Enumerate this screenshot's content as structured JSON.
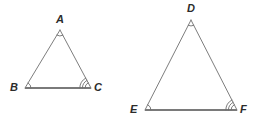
{
  "figure": {
    "background_color": "#ffffff",
    "width": 267,
    "height": 123,
    "stroke_color": "#6e6e6e",
    "base_stroke_color": "#7a7a7a",
    "arc_color": "#6e6e6e",
    "label_color": "#2b2b2b",
    "side_stroke_width": 0.9,
    "base_stroke_width": 2.0
  },
  "triangles": [
    {
      "id": "triangle-abc",
      "name": "triangle ABC",
      "vertices": [
        {
          "label": "A",
          "x": 60,
          "y": 30,
          "arcs": 1,
          "label_x": 56,
          "label_y": 14
        },
        {
          "label": "B",
          "x": 25,
          "y": 88,
          "arcs": 1,
          "label_x": 10,
          "label_y": 82
        },
        {
          "label": "C",
          "x": 91,
          "y": 88,
          "arcs": 3,
          "label_x": 94,
          "label_y": 82
        }
      ]
    },
    {
      "id": "triangle-def",
      "name": "triangle DEF",
      "vertices": [
        {
          "label": "D",
          "x": 191,
          "y": 20,
          "arcs": 1,
          "label_x": 187,
          "label_y": 3
        },
        {
          "label": "E",
          "x": 145,
          "y": 110,
          "arcs": 1,
          "label_x": 130,
          "label_y": 104
        },
        {
          "label": "F",
          "x": 237,
          "y": 110,
          "arcs": 3,
          "label_x": 240,
          "label_y": 104
        }
      ]
    }
  ],
  "labels": {
    "a": "A",
    "b": "B",
    "c": "C",
    "d": "D",
    "e": "E",
    "f": "F"
  }
}
